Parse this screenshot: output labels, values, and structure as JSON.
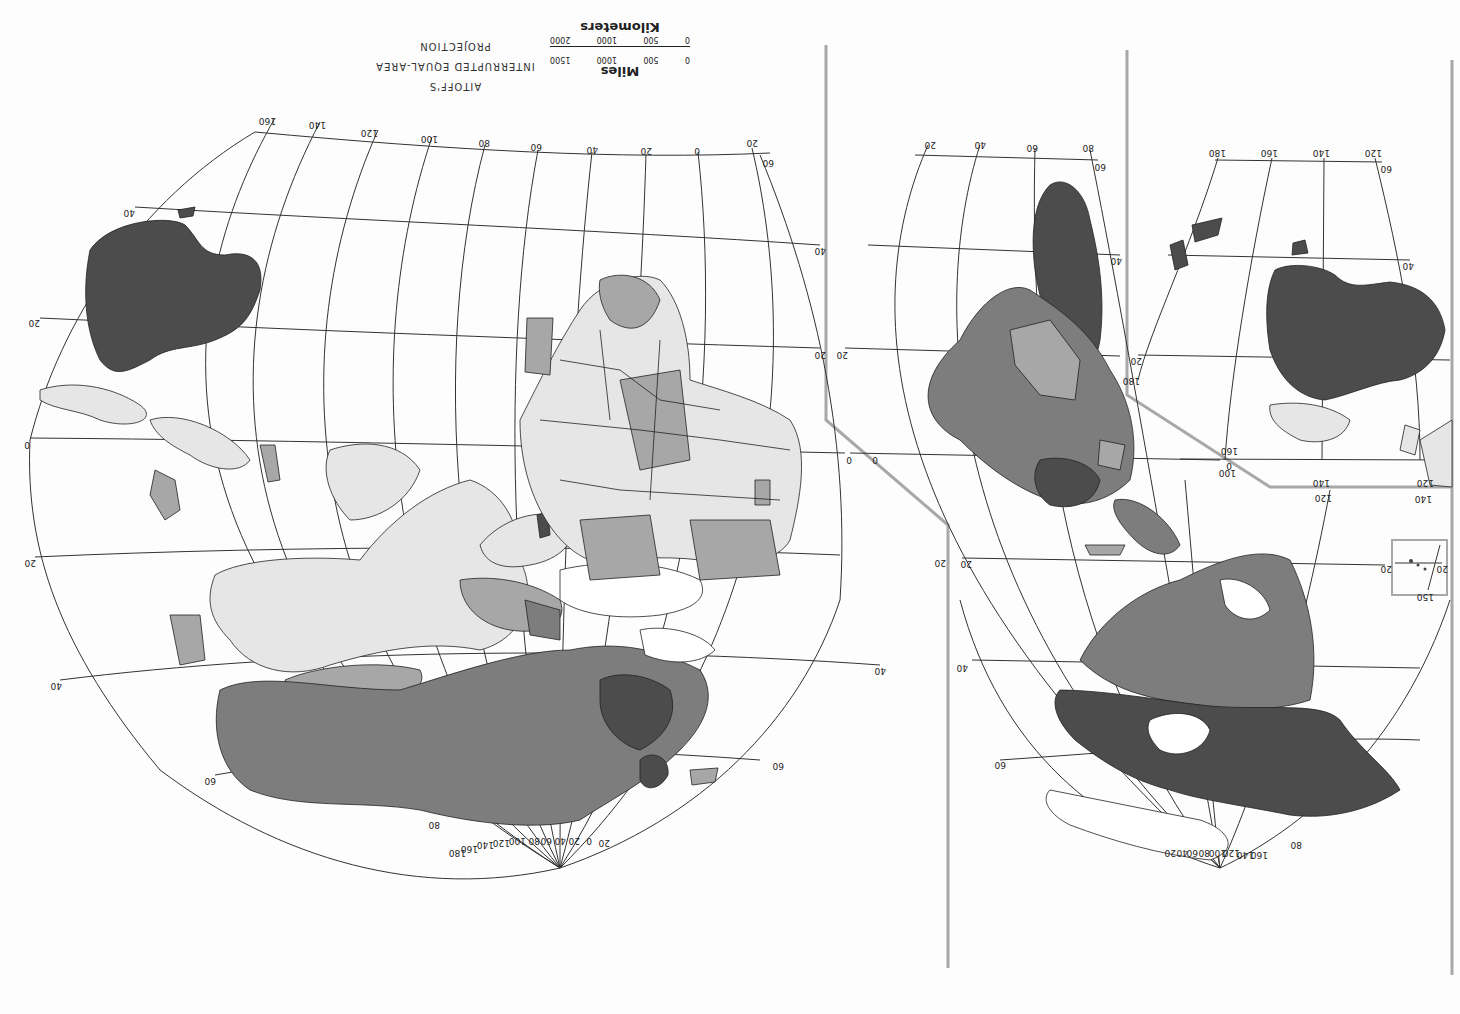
{
  "map": {
    "orientation": "rotated 180 degrees (south up)",
    "title_lines": [
      "AITOFF'S",
      "INTERRUPTED EQUAL-AREA",
      "PROJECTION"
    ],
    "scale": {
      "miles_label": "Miles",
      "miles_ticks": [
        "0",
        "500",
        "1000",
        "1500"
      ],
      "km_label": "Kilometers",
      "km_ticks": [
        "0",
        "500",
        "1000",
        "2000"
      ]
    },
    "fill_classes": {
      "darkest": "#4c4c4c",
      "dark": "#7d7d7d",
      "medium": "#a7a7a7",
      "light": "#e6e6e6",
      "none": "#ffffff"
    },
    "frame_color": "#a8a8a8",
    "left_lobe": {
      "meridian_labels_top": [
        "160",
        "140",
        "120",
        "100",
        "80",
        "60",
        "40",
        "20",
        "0",
        "20"
      ],
      "parallel_labels_left": [
        "40",
        "20",
        "0",
        "20",
        "40",
        "60"
      ],
      "parallel_labels_right": [
        "60",
        "40",
        "20",
        "0",
        "20",
        "40",
        "60"
      ],
      "meridian_labels_bottom": [
        "80",
        "180",
        "160",
        "140",
        "120",
        "100",
        "80",
        "60",
        "40",
        "20",
        "0",
        "20"
      ]
    },
    "right_lobe": {
      "meridian_labels_top": [
        "20",
        "40",
        "60",
        "80"
      ],
      "parallel_labels": [
        "60",
        "40",
        "20",
        "0",
        "20",
        "40",
        "60"
      ],
      "meridian_labels_bottom": [
        "20",
        "40",
        "60",
        "80",
        "100",
        "120",
        "140",
        "160",
        "80"
      ]
    },
    "inset_oceania": {
      "meridian_labels_top": [
        "180",
        "160",
        "140",
        "120"
      ],
      "parallel_labels": [
        "60",
        "40",
        "20",
        "0"
      ],
      "bottom_labels": [
        "160",
        "100",
        "140",
        "120",
        "120",
        "140",
        "180"
      ]
    },
    "inset_hawaii": {
      "labels": [
        "20",
        "20",
        "150"
      ]
    }
  }
}
